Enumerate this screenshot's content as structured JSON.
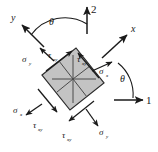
{
  "figure": {
    "type": "stress-element-rotation-diagram",
    "element_fill": "#c3c3c3",
    "element_stroke": "#2b2b2b",
    "arrow_color": "#1a1a1a",
    "background": "#ffffff",
    "rotation_deg": 30
  },
  "axes": {
    "global": {
      "axis_1": {
        "label": "1",
        "direction": "horizontal-right"
      },
      "axis_2": {
        "label": "2",
        "direction": "vertical-up"
      }
    },
    "local": {
      "axis_x": {
        "label": "x",
        "direction": "up-right"
      },
      "axis_y": {
        "label": "y",
        "direction": "up-left"
      }
    }
  },
  "angles": {
    "theta_top": {
      "symbol": "θ",
      "between": "y-axis and 2-axis"
    },
    "theta_right": {
      "symbol": "θ",
      "between": "1-axis and x-axis"
    }
  },
  "stress_labels": {
    "sigma": "σ",
    "tau": "τ",
    "sigma_x_sub": "x",
    "sigma_y_sub": "y",
    "tau_xy_sub": "xy"
  },
  "annotations": [
    {
      "name": "sigma-y-top-left",
      "symbol": "σ",
      "subscript": "y"
    },
    {
      "name": "tau-xy-top-left",
      "symbol": "τ",
      "subscript": "xy"
    },
    {
      "name": "tau-xy-top-right",
      "symbol": "τ",
      "subscript": "xy"
    },
    {
      "name": "sigma-x-right",
      "symbol": "σ",
      "subscript": "x"
    },
    {
      "name": "sigma-x-left",
      "symbol": "σ",
      "subscript": "x"
    },
    {
      "name": "tau-xy-bottom-left",
      "symbol": "τ",
      "subscript": "xy"
    },
    {
      "name": "tau-xy-bottom-right",
      "symbol": "τ",
      "subscript": "xy"
    },
    {
      "name": "sigma-y-bottom",
      "symbol": "σ",
      "subscript": "y"
    }
  ]
}
